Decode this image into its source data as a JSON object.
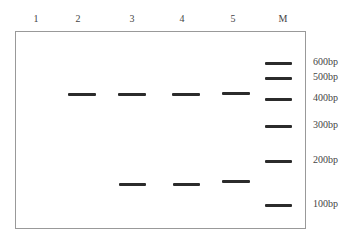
{
  "lanes": [
    {
      "label": "1",
      "center_x": 36
    },
    {
      "label": "2",
      "center_x": 78
    },
    {
      "label": "3",
      "center_x": 132
    },
    {
      "label": "4",
      "center_x": 182
    },
    {
      "label": "5",
      "center_x": 233
    },
    {
      "label": "M",
      "center_x": 283
    }
  ],
  "marker": {
    "sizes": [
      {
        "label": "600bp",
        "y": 63
      },
      {
        "label": "500bp",
        "y": 78
      },
      {
        "label": "400bp",
        "y": 99
      },
      {
        "label": "300bp",
        "y": 126
      },
      {
        "label": "200bp",
        "y": 161
      },
      {
        "label": "100bp",
        "y": 205
      }
    ]
  },
  "sample_bands": [
    {
      "lane": "2",
      "x": 68,
      "y": 94,
      "w": 28
    },
    {
      "lane": "3",
      "x": 118,
      "y": 94,
      "w": 28
    },
    {
      "lane": "4",
      "x": 172,
      "y": 94,
      "w": 28
    },
    {
      "lane": "5",
      "x": 222,
      "y": 93,
      "w": 28
    },
    {
      "lane": "3",
      "x": 119,
      "y": 184,
      "w": 27
    },
    {
      "lane": "4",
      "x": 173,
      "y": 184,
      "w": 27
    },
    {
      "lane": "5",
      "x": 222,
      "y": 181,
      "w": 28
    }
  ],
  "colors": {
    "band": "#2b2b2b",
    "border": "#999999"
  }
}
